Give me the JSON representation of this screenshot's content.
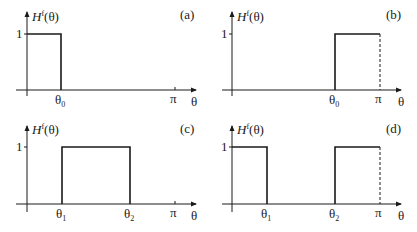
{
  "figure": {
    "panels": [
      {
        "id": "a",
        "label": "(a)",
        "ylabel_H": "H",
        "ylabel_sup": "f",
        "ylabel_arg": "(θ)",
        "ytick": "1",
        "xlabel": "θ",
        "pi_label": "π",
        "ticks": [
          {
            "sym": "θ",
            "sub": "0"
          }
        ],
        "description": "Low-pass: H=1 for 0 ≤ θ ≤ θ0, 0 otherwise"
      },
      {
        "id": "b",
        "label": "(b)",
        "ylabel_H": "H",
        "ylabel_sup": "f",
        "ylabel_arg": "(θ)",
        "ytick": "1",
        "xlabel": "θ",
        "pi_label": "π",
        "ticks": [
          {
            "sym": "θ",
            "sub": "0"
          }
        ],
        "description": "High-pass: H=1 for θ0 ≤ θ ≤ π, dashed line at π"
      },
      {
        "id": "c",
        "label": "(c)",
        "ylabel_H": "H",
        "ylabel_sup": "f",
        "ylabel_arg": "(θ)",
        "ytick": "1",
        "xlabel": "θ",
        "pi_label": "π",
        "ticks": [
          {
            "sym": "θ",
            "sub": "1"
          },
          {
            "sym": "θ",
            "sub": "2"
          }
        ],
        "description": "Band-pass: H=1 for θ1 ≤ θ ≤ θ2"
      },
      {
        "id": "d",
        "label": "(d)",
        "ylabel_H": "H",
        "ylabel_sup": "f",
        "ylabel_arg": "(θ)",
        "ytick": "1",
        "xlabel": "θ",
        "pi_label": "π",
        "ticks": [
          {
            "sym": "θ",
            "sub": "1"
          },
          {
            "sym": "θ",
            "sub": "2"
          }
        ],
        "description": "Band-stop: H=1 for 0 ≤ θ ≤ θ1 and θ2 ≤ θ ≤ π, dashed line at π"
      }
    ]
  }
}
